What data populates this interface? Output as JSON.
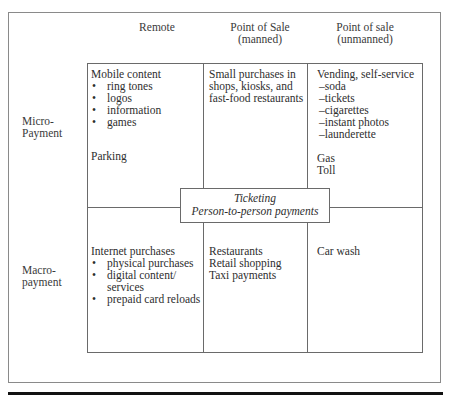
{
  "diagram": {
    "column_headers": [
      {
        "lines": [
          "Remote"
        ]
      },
      {
        "lines": [
          "Point of Sale",
          "(manned)"
        ]
      },
      {
        "lines": [
          "Point of sale",
          "(unmanned)"
        ]
      }
    ],
    "row_headers": [
      {
        "lines": [
          "Micro-",
          "Payment"
        ]
      },
      {
        "lines": [
          "Macro-",
          "payment"
        ]
      }
    ],
    "cells": {
      "micro_remote": {
        "title": "Mobile content",
        "bullets": [
          "ring tones",
          "logos",
          "information",
          "games"
        ],
        "bullet_glyph": "•",
        "extra": "Parking"
      },
      "micro_manned": {
        "lines": [
          "Small purchases in",
          "shops, kiosks, and",
          "fast-food restaurants"
        ]
      },
      "micro_unmanned": {
        "title": "Vending, self-service",
        "dash_items": [
          "–soda",
          "–tickets",
          "–cigarettes",
          "–instant photos",
          "–launderette"
        ],
        "extra": [
          "Gas",
          "Toll"
        ]
      },
      "macro_remote": {
        "title": "Internet purchases",
        "bullets": [
          "physical purchases",
          "digital content/",
          "services",
          "prepaid card reloads"
        ],
        "bullet_glyph": "•"
      },
      "macro_manned": {
        "lines": [
          "Restaurants",
          "Retail shopping",
          "Taxi payments"
        ]
      },
      "macro_unmanned": {
        "lines": [
          "Car wash"
        ]
      }
    },
    "overlay": {
      "lines": [
        "Ticketing",
        "Person-to-person payments"
      ]
    }
  }
}
